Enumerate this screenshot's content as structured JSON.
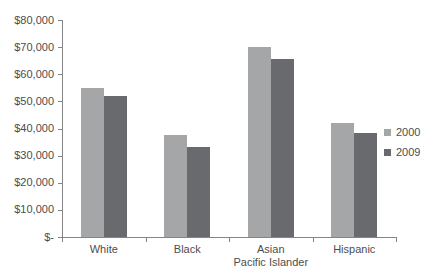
{
  "chart_data": {
    "type": "bar",
    "title": "",
    "xlabel": "",
    "ylabel": "",
    "categories": [
      "White",
      "Black",
      "Asian Pacific Islander",
      "Hispanic"
    ],
    "series": [
      {
        "name": "2000",
        "color": "#a4a6a8",
        "values": [
          55000,
          37500,
          70000,
          42000
        ]
      },
      {
        "name": "2009",
        "color": "#686a6d",
        "values": [
          52000,
          33000,
          65500,
          38500
        ]
      }
    ],
    "ylim": [
      0,
      80000
    ],
    "ytick_step": 10000,
    "ytick_labels": [
      "$-",
      "$10,000",
      "$20,000",
      "$30,000",
      "$40,000",
      "$50,000",
      "$60,000",
      "$70,000",
      "$80,000"
    ],
    "grid": false,
    "legend_position": "right",
    "axis_color": "#848484",
    "text_color": "#4d4d4d",
    "background_color": "#ffffff"
  }
}
